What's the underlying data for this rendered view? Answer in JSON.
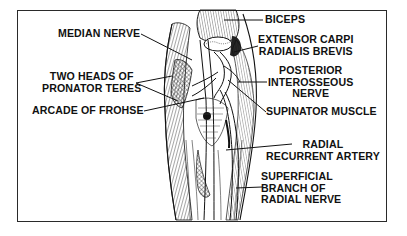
{
  "figure": {
    "labels_left": [
      {
        "id": "median-nerve",
        "lines": [
          "MEDIAN NERVE"
        ]
      },
      {
        "id": "pronator-teres",
        "lines": [
          "TWO HEADS OF",
          "PRONATOR TERES"
        ]
      },
      {
        "id": "arcade-of-frohse",
        "lines": [
          "ARCADE OF FROHSE"
        ]
      }
    ],
    "labels_right": [
      {
        "id": "biceps",
        "lines": [
          "BICEPS"
        ]
      },
      {
        "id": "extensor-carpi",
        "lines": [
          "EXTENSOR CARPI",
          "RADIALIS BREVIS"
        ]
      },
      {
        "id": "posterior-interosseous",
        "lines": [
          "POSTERIOR",
          "INTEROSSEOUS",
          "NERVE"
        ]
      },
      {
        "id": "supinator",
        "lines": [
          "SUPINATOR MUSCLE"
        ]
      },
      {
        "id": "radial-recurrent",
        "lines": [
          "RADIAL",
          "RECURRENT ARTERY"
        ]
      },
      {
        "id": "superficial-branch",
        "lines": [
          "SUPERFICIAL",
          "BRANCH OF",
          "RADIAL NERVE"
        ]
      }
    ],
    "colors": {
      "ink": "#111111",
      "frame": "#2a2a2a",
      "background": "#ffffff"
    }
  }
}
